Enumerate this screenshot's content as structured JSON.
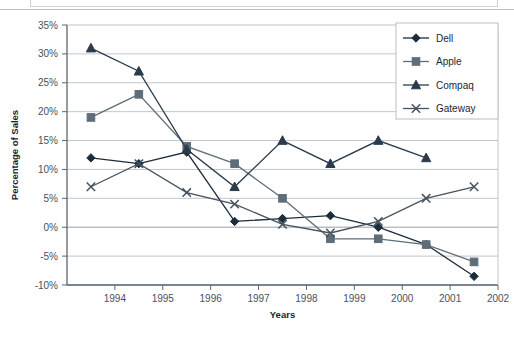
{
  "figure": {
    "top_clipped_caption": "a graph representing the percentage change in sales",
    "plot_background": "#ffffff",
    "gridline_color": "#b9bfc5",
    "axis_color": "#5b6671"
  },
  "axes": {
    "y_title": "Percentage of Sales",
    "x_title": "Years",
    "y_ticks": [
      "35%",
      "30%",
      "25%",
      "20%",
      "15%",
      "10%",
      "5%",
      "0%",
      "-5%",
      "-10%"
    ],
    "x_ticks": [
      "1994",
      "1995",
      "1996",
      "1997",
      "1998",
      "1999",
      "2000",
      "2001",
      "2002"
    ]
  },
  "legend": {
    "position": "top-right",
    "items": [
      {
        "label": "Dell",
        "marker": "diamond-marker",
        "color": "#1b2d3c"
      },
      {
        "label": "Apple",
        "marker": "square-marker",
        "color": "#5e6d78"
      },
      {
        "label": "Compaq",
        "marker": "triangle-marker",
        "color": "#2a3c4c"
      },
      {
        "label": "Gateway",
        "marker": "cross-marker",
        "color": "#46525e"
      }
    ]
  },
  "chart_data": {
    "type": "line",
    "title": "",
    "xlabel": "Years",
    "ylabel": "Percentage of Sales",
    "xlim": [
      1993,
      2002
    ],
    "ylim": [
      -10,
      35
    ],
    "ytick_step": 5,
    "grid": true,
    "legend_position": "top-right",
    "x": [
      1993.5,
      1994.5,
      1995.5,
      1996.5,
      1997.5,
      1998.5,
      1999.5,
      2000.5,
      2001.5
    ],
    "series": [
      {
        "name": "Dell",
        "marker": "diamond",
        "color": "#1b2d3c",
        "values": [
          12,
          11,
          13,
          1,
          1.5,
          2,
          0,
          -3,
          -8.5
        ]
      },
      {
        "name": "Apple",
        "marker": "square",
        "color": "#5e6d78",
        "values": [
          19,
          23,
          14,
          11,
          5,
          -2,
          -2,
          -3,
          -6
        ]
      },
      {
        "name": "Compaq",
        "marker": "triangle",
        "color": "#2a3c4c",
        "values": [
          31,
          27,
          13.5,
          7,
          15,
          11,
          15,
          12,
          null
        ]
      },
      {
        "name": "Gateway",
        "marker": "cross",
        "color": "#46525e",
        "values": [
          7,
          11,
          6,
          4,
          0.5,
          -1,
          1,
          5,
          7
        ]
      }
    ]
  }
}
